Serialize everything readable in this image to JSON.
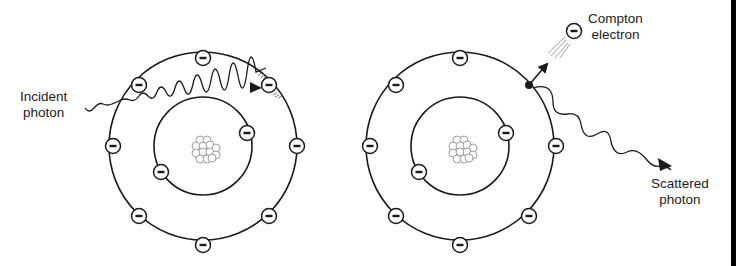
{
  "diagram": {
    "left_panel": {
      "atom_center": [
        203,
        146
      ],
      "outer_shell_radius": 94,
      "inner_shell_radius": 49,
      "outer_electron_angles_deg": [
        -90,
        -45,
        0,
        45,
        90,
        135,
        180,
        225
      ],
      "inner_electron_angles_deg": [
        -35,
        145
      ],
      "incident_photon_label": [
        "Incident",
        "photon"
      ]
    },
    "right_panel": {
      "atom_center": [
        460,
        146
      ],
      "outer_shell_radius": 94,
      "inner_shell_radius": 49,
      "outer_electron_angles_deg": [
        -90,
        0,
        45,
        90,
        135,
        180,
        225
      ],
      "inner_electron_angles_deg": [
        -35,
        145
      ],
      "ejection_point_angle_deg": -45,
      "compton_electron_label": [
        "Compton",
        "electron"
      ],
      "scattered_photon_label": [
        "Scattered",
        "photon"
      ]
    },
    "colors": {
      "line": "#1a1a1a",
      "background": "#ffffff",
      "text": "#222222",
      "nucleon_stroke": "#777777"
    }
  }
}
